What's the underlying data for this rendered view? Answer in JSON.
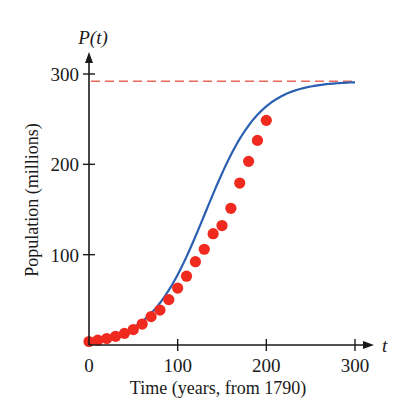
{
  "chart_data": {
    "type": "scatter",
    "title": "",
    "xlabel": "Time (years, from 1790)",
    "ylabel": "Population (millions)",
    "x_axis_var": "t",
    "y_axis_var": "P(t)",
    "xlim": [
      0,
      300
    ],
    "ylim": [
      0,
      300
    ],
    "x_ticks": [
      0,
      100,
      200,
      300
    ],
    "y_ticks": [
      100,
      200,
      300
    ],
    "grid": false,
    "colors": {
      "points": "#f02a1e",
      "curve": "#2b5fb0",
      "asymptote": "#e8695a",
      "axis": "#1a1a1a"
    },
    "series": [
      {
        "name": "Census data",
        "kind": "scatter",
        "x": [
          0,
          10,
          20,
          30,
          40,
          50,
          60,
          70,
          80,
          90,
          100,
          110,
          120,
          130,
          140,
          150,
          160,
          170,
          180,
          190,
          200
        ],
        "values": [
          3.9,
          5.3,
          7.2,
          9.6,
          12.9,
          17.1,
          23.2,
          31.4,
          38.6,
          50.2,
          63.0,
          76.2,
          92.2,
          106.0,
          123.2,
          132.2,
          151.3,
          179.3,
          203.3,
          226.5,
          248.7
        ]
      },
      {
        "name": "Logistic model",
        "kind": "line",
        "carrying_capacity": 292,
        "x": [
          0,
          20,
          40,
          60,
          80,
          100,
          120,
          140,
          160,
          180,
          200,
          220,
          240,
          260,
          280,
          300
        ],
        "values": [
          4.0,
          7.6,
          14.3,
          26.4,
          46.9,
          78.8,
          121.0,
          165.4,
          203.0,
          233.3,
          253.8,
          268.7,
          278.0,
          283.6,
          287.2,
          289.5
        ]
      },
      {
        "name": "Carrying capacity",
        "kind": "dashed-hline",
        "y": 292,
        "x_range": [
          0,
          300
        ]
      }
    ]
  }
}
